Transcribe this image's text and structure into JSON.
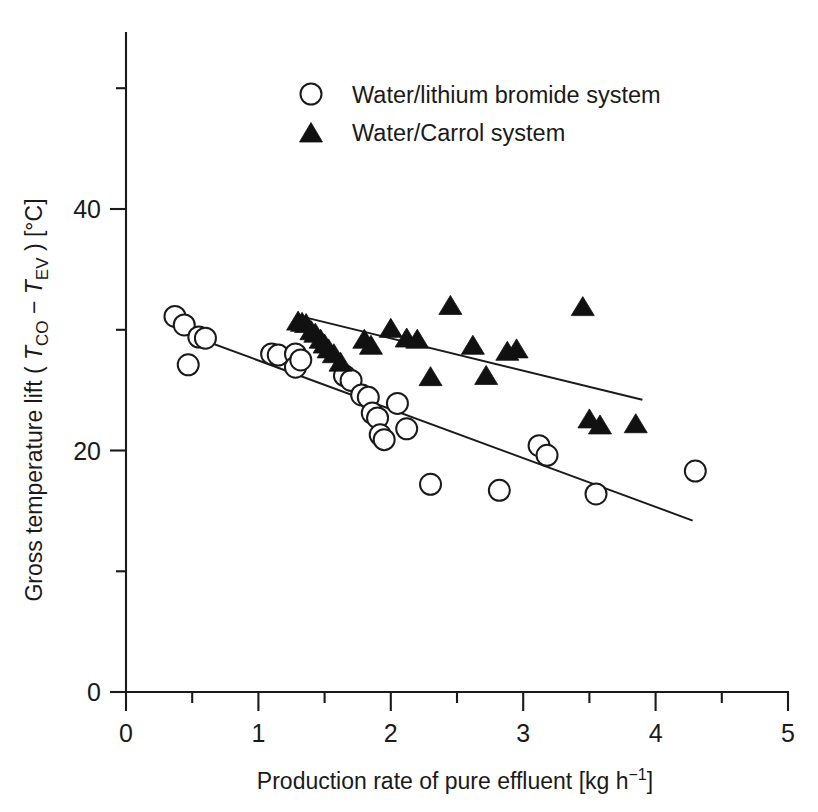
{
  "chart_data": {
    "type": "scatter",
    "title": "",
    "xlabel": "Production rate of pure effluent [kg h⁻¹]",
    "xlabel_parts": {
      "main": "Production rate of pure effluent [kg h",
      "sup": "−1",
      "tail": "]"
    },
    "ylabel": "Gross temperature lift ( T_CO − T_EV ) [°C]",
    "ylabel_parts": {
      "p1": "Gross temperature lift ( ",
      "t1": "T",
      "s1": "CO",
      "minus": " − ",
      "t2": "T",
      "s2": "EV",
      "p2": " ) [°C]"
    },
    "xlim": [
      0,
      5
    ],
    "ylim": [
      0,
      52
    ],
    "x_ticks": [
      0,
      1,
      2,
      3,
      4,
      5
    ],
    "x_tick_labels": [
      "0",
      "1",
      "2",
      "3",
      "4",
      "5"
    ],
    "x_minor_ticks": [
      0.5,
      1.5,
      2.5,
      3.5,
      4.5
    ],
    "y_ticks": [
      0,
      20,
      40
    ],
    "y_tick_labels": [
      "0",
      "20",
      "40"
    ],
    "y_minor_ticks": [
      10,
      30,
      50
    ],
    "grid": false,
    "legend_position": "top-center",
    "series": [
      {
        "name": "Water/lithium bromide system",
        "marker": "open-circle",
        "color": "#ffffff",
        "edge_color": "#1a1a1a",
        "points": [
          [
            0.37,
            31.1
          ],
          [
            0.44,
            30.4
          ],
          [
            0.47,
            27.1
          ],
          [
            0.55,
            29.4
          ],
          [
            0.6,
            29.3
          ],
          [
            1.1,
            28.0
          ],
          [
            1.15,
            27.9
          ],
          [
            1.28,
            28.0
          ],
          [
            1.28,
            26.9
          ],
          [
            1.32,
            27.5
          ],
          [
            1.65,
            26.2
          ],
          [
            1.7,
            25.8
          ],
          [
            1.78,
            24.6
          ],
          [
            1.83,
            24.4
          ],
          [
            1.86,
            23.1
          ],
          [
            1.9,
            22.7
          ],
          [
            1.92,
            21.3
          ],
          [
            1.95,
            20.9
          ],
          [
            2.05,
            23.9
          ],
          [
            2.12,
            21.8
          ],
          [
            2.3,
            17.2
          ],
          [
            2.82,
            16.7
          ],
          [
            3.12,
            20.4
          ],
          [
            3.18,
            19.6
          ],
          [
            3.55,
            16.4
          ],
          [
            4.3,
            18.3
          ]
        ]
      },
      {
        "name": "Water/Carrol system",
        "marker": "filled-triangle",
        "color": "#111111",
        "edge_color": "#111111",
        "points": [
          [
            1.3,
            30.6
          ],
          [
            1.33,
            30.5
          ],
          [
            1.36,
            30.4
          ],
          [
            1.4,
            29.8
          ],
          [
            1.43,
            29.6
          ],
          [
            1.47,
            29.1
          ],
          [
            1.5,
            28.7
          ],
          [
            1.53,
            28.3
          ],
          [
            1.57,
            27.9
          ],
          [
            1.62,
            27.2
          ],
          [
            1.8,
            29.1
          ],
          [
            1.85,
            28.6
          ],
          [
            2.0,
            30.0
          ],
          [
            2.12,
            29.2
          ],
          [
            2.2,
            29.1
          ],
          [
            2.3,
            26.0
          ],
          [
            2.45,
            31.9
          ],
          [
            2.62,
            28.6
          ],
          [
            2.72,
            26.1
          ],
          [
            2.88,
            28.1
          ],
          [
            2.95,
            28.3
          ],
          [
            3.45,
            31.8
          ],
          [
            3.5,
            22.5
          ],
          [
            3.58,
            22.0
          ],
          [
            3.85,
            22.1
          ]
        ]
      }
    ],
    "fit_lines": [
      {
        "for_series": "Water/lithium bromide system",
        "x": [
          0.37,
          4.28
        ],
        "y": [
          30.0,
          14.2
        ]
      },
      {
        "for_series": "Water/Carrol system",
        "x": [
          1.36,
          3.9
        ],
        "y": [
          31.0,
          24.2
        ]
      }
    ]
  },
  "legend": {
    "items": [
      {
        "marker": "open-circle",
        "label": "Water/lithium bromide system"
      },
      {
        "marker": "filled-triangle",
        "label": "Water/Carrol system"
      }
    ]
  }
}
